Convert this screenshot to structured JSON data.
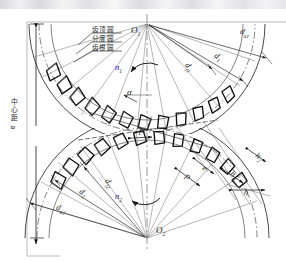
{
  "figure": {
    "type": "engineering-drawing",
    "width": 286,
    "height": 262,
    "background": "#ffffff",
    "line_color": "#1a1a1a",
    "thin_line_color": "#5a5a5a"
  },
  "centers": {
    "upper": {
      "label": "O",
      "sub": "1",
      "x": 147,
      "y": 24
    },
    "lower": {
      "label": "O",
      "sub": "2",
      "x": 147,
      "y": 238
    }
  },
  "circle_callouts": [
    {
      "name": "addendum-circle",
      "label": "齿顶圆",
      "x": 92,
      "y": 29
    },
    {
      "name": "pitch-circle",
      "label": "分度圆",
      "x": 92,
      "y": 38
    },
    {
      "name": "dedendum-circle",
      "label": "齿根圆",
      "x": 92,
      "y": 47
    }
  ],
  "center_distance": {
    "label": "中心距",
    "symbol": "a",
    "text": "中心距 a",
    "x": 9,
    "y": 100
  },
  "diameters_upper": [
    {
      "name": "addendum-diameter-1",
      "label": "d",
      "sub": "a1",
      "x": 243,
      "y": 33
    },
    {
      "name": "pitch-diameter-1",
      "label": "d",
      "sub": "1",
      "x": 217,
      "y": 57
    },
    {
      "name": "root-diameter-1",
      "label": "d",
      "sub": "f1",
      "x": 188,
      "y": 68
    }
  ],
  "diameters_lower": [
    {
      "name": "addendum-diameter-2",
      "label": "d",
      "sub": "a2",
      "x": 58,
      "y": 209
    },
    {
      "name": "pitch-diameter-2",
      "label": "d",
      "sub": "2",
      "x": 80,
      "y": 193
    },
    {
      "name": "root-diameter-2",
      "label": "d",
      "sub": "f2",
      "x": 105,
      "y": 183
    }
  ],
  "rotation": [
    {
      "name": "rotation-n1",
      "label": "n",
      "sub": "1",
      "x": 116,
      "y": 68,
      "direction": "ccw"
    },
    {
      "name": "rotation-n2",
      "label": "n",
      "sub": "2",
      "x": 116,
      "y": 196,
      "direction": "cw"
    }
  ],
  "annotations": [
    {
      "name": "pressure-angle",
      "label": "α",
      "sub": "",
      "x": 129,
      "y": 94
    },
    {
      "name": "pitch-center",
      "label": "p",
      "sub": "",
      "x": 141,
      "y": 131
    },
    {
      "name": "pitch-right",
      "label": "p",
      "sub": "",
      "x": 188,
      "y": 177
    },
    {
      "name": "space-width",
      "label": "e",
      "sub": "",
      "x": 205,
      "y": 170
    },
    {
      "name": "addendum-h1",
      "label": "h",
      "sub": "1",
      "x": 233,
      "y": 177
    },
    {
      "name": "dedendum-h2",
      "label": "h",
      "sub": "2",
      "x": 258,
      "y": 159
    },
    {
      "name": "tooth-height-h",
      "label": "h",
      "sub": "",
      "x": 246,
      "y": 194
    }
  ]
}
